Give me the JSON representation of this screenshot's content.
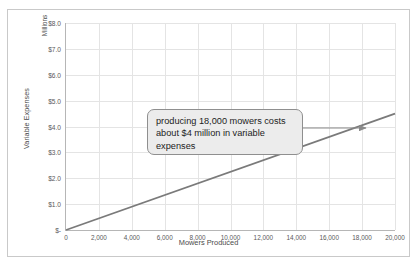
{
  "chart_data": {
    "type": "line",
    "title": "",
    "xlabel": "Mowers Produced",
    "ylabel": "Variable Expenses",
    "y_unit_label": "Millions",
    "xlim": [
      0,
      20000
    ],
    "ylim": [
      0,
      8000000
    ],
    "grid": true,
    "legend": "none",
    "x_ticks": [
      "0",
      "2,000",
      "4,000",
      "6,000",
      "8,000",
      "10,000",
      "12,000",
      "14,000",
      "16,000",
      "18,000",
      "20,000"
    ],
    "x_tick_values": [
      0,
      2000,
      4000,
      6000,
      8000,
      10000,
      12000,
      14000,
      16000,
      18000,
      20000
    ],
    "y_ticks": [
      "$-",
      "$1.0",
      "$2.0",
      "$3.0",
      "$4.0",
      "$5.0",
      "$6.0",
      "$7.0",
      "$8.0"
    ],
    "y_tick_values": [
      0,
      1000000,
      2000000,
      3000000,
      4000000,
      5000000,
      6000000,
      7000000,
      8000000
    ],
    "series": [
      {
        "name": "Variable Expenses",
        "color": "#7a7a7a",
        "x": [
          0,
          20000
        ],
        "values": [
          0,
          4500000
        ]
      }
    ],
    "annotations": [
      {
        "text": "producing 18,000 mowers costs about $4 million in variable expenses",
        "points_to_x": 18000,
        "points_to_y": 4000000
      }
    ]
  },
  "chart": {
    "y_axis_title": "Variable Expenses",
    "y_axis_unit": "Millions",
    "x_axis_title": "Mowers Produced"
  },
  "annotation": {
    "text": "producing 18,000 mowers costs about $4 million in variable expenses"
  }
}
